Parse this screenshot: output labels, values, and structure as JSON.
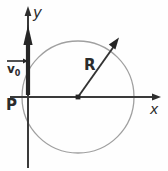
{
  "figure": {
    "type": "geometry-diagram",
    "background_color": "#fefefe",
    "axes": {
      "x_axis": {
        "label": "x",
        "color": "#3a3a3a",
        "origin_px": [
          28,
          97
        ],
        "end_px": [
          160,
          97
        ],
        "arrowhead": "right"
      },
      "y_axis": {
        "label": "y",
        "color": "#3a3a3a",
        "origin_px": [
          28,
          97
        ],
        "end_px": [
          28,
          12
        ],
        "bottom_px": [
          28,
          168
        ],
        "arrowhead": "up"
      }
    },
    "circle": {
      "center_px": [
        78,
        97
      ],
      "radius_px": 56,
      "stroke_color": "#9a9a9a",
      "stroke_width": 1.2,
      "fill": "none",
      "tangent_point_label": "P"
    },
    "radius_vector": {
      "label": "R",
      "from_px": [
        78,
        97
      ],
      "to_px": [
        118,
        40
      ],
      "color": "#3a3a3a",
      "arrowhead": "tip"
    },
    "velocity_vector": {
      "label": "v",
      "subscript": "0",
      "label_full": "v₀",
      "overline_arrow": true,
      "from_px": [
        28,
        97
      ],
      "to_px": [
        28,
        31
      ],
      "color": "#2b2b2b",
      "style": "thick-filled-arrow"
    },
    "center_dot": {
      "at_px": [
        78,
        97
      ],
      "color": "#2b2b2b",
      "size_px": 4
    },
    "labels": {
      "y": "y",
      "x": "x",
      "P": "P",
      "R": "R",
      "v0_base": "v",
      "v0_sub": "0"
    }
  }
}
